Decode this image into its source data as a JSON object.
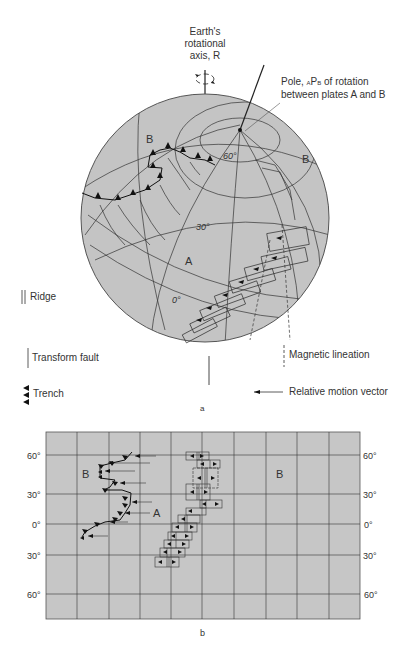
{
  "figure_a": {
    "caption": "a",
    "axis_label": [
      "Earth's",
      "rotational",
      "axis, R"
    ],
    "pole_label_prefix": "Pole, ",
    "pole_sub_a": "A",
    "pole_main": "P",
    "pole_sub_b": "B",
    "pole_label_suffix": " of rotation",
    "pole_label_line2": "between plates A and B",
    "plate_labels": {
      "a": "A",
      "b_left": "B",
      "b_right": "B"
    },
    "latitude_labels": {
      "lat60": "60°",
      "lat30": "30°",
      "lat0": "0°"
    },
    "legend": {
      "ridge": "Ridge",
      "transform": "Transform fault",
      "trench": "Trench",
      "magnetic": "Magnetic lineation",
      "motion": "Relative motion vector"
    }
  },
  "figure_b": {
    "caption": "b",
    "left_lat_labels": [
      "60°",
      "30°",
      "0°",
      "30°",
      "60°"
    ],
    "right_lat_labels": [
      "60°",
      "30°",
      "0°",
      "30°",
      "60°"
    ],
    "plate_labels": {
      "b_left": "B",
      "a": "A",
      "b_right": "B"
    }
  },
  "colors": {
    "globe_fill": "#c4c4c4",
    "map_fill": "#c6c6c6",
    "line": "#2b2b2b",
    "text": "#333333"
  }
}
